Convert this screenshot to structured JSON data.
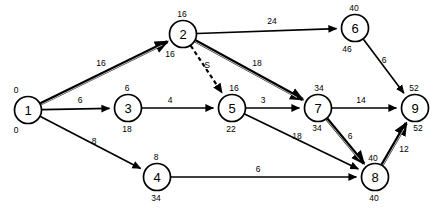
{
  "diagram": {
    "type": "activity-on-arrow-network",
    "background_color": "#ffffff",
    "line_color": "#000000",
    "critical_path": [
      "1",
      "2",
      "7",
      "8",
      "9"
    ],
    "nodes": [
      {
        "id": "1",
        "label": "1",
        "early": "0",
        "late": "0",
        "x": 28,
        "y": 110,
        "r": 13.5,
        "early_dx": -12,
        "early_dy": -17,
        "late_dx": -12,
        "late_dy": 23
      },
      {
        "id": "2",
        "label": "2",
        "early": "16",
        "late": "16",
        "x": 183,
        "y": 34,
        "r": 13.5,
        "early_dx": -1,
        "early_dy": -17,
        "late_dx": -13,
        "late_dy": 23
      },
      {
        "id": "3",
        "label": "3",
        "early": "6",
        "late": "18",
        "x": 128,
        "y": 108,
        "r": 13.5,
        "early_dx": -1,
        "early_dy": -17,
        "late_dx": -1,
        "late_dy": 24
      },
      {
        "id": "4",
        "label": "4",
        "early": "8",
        "late": "34",
        "x": 157,
        "y": 177,
        "r": 13.5,
        "early_dx": -1,
        "early_dy": -17,
        "late_dx": -1,
        "late_dy": 24
      },
      {
        "id": "5",
        "label": "5",
        "early": "16",
        "late": "22",
        "x": 232,
        "y": 108,
        "r": 13.5,
        "early_dx": 2,
        "early_dy": -17,
        "late_dx": -1,
        "late_dy": 24
      },
      {
        "id": "6",
        "label": "6",
        "early": "40",
        "late": "46",
        "x": 355,
        "y": 28,
        "r": 13.5,
        "early_dx": -1,
        "early_dy": -17,
        "late_dx": -8,
        "late_dy": 24
      },
      {
        "id": "7",
        "label": "7",
        "early": "34",
        "late": "34",
        "x": 318,
        "y": 108,
        "r": 13.5,
        "early_dx": 1,
        "early_dy": -17,
        "late_dx": -1,
        "late_dy": 23
      },
      {
        "id": "8",
        "label": "8",
        "early": "40",
        "late": "40",
        "x": 375,
        "y": 177,
        "r": 13.5,
        "early_dx": -2,
        "early_dy": -16,
        "late_dx": -1,
        "late_dy": 24
      },
      {
        "id": "9",
        "label": "9",
        "early": "52",
        "late": "52",
        "x": 415,
        "y": 108,
        "r": 13.5,
        "early_dx": -1,
        "early_dy": -17,
        "late_dx": 3,
        "late_dy": 23
      }
    ],
    "edges": [
      {
        "id": "e-1-2",
        "from": "1",
        "to": "2",
        "label": "16",
        "style": "critical",
        "label_x": 101,
        "label_y": 66
      },
      {
        "id": "e-1-3",
        "from": "1",
        "to": "3",
        "label": "6",
        "style": "normal",
        "label_x": 80,
        "label_y": 103
      },
      {
        "id": "e-1-4",
        "from": "1",
        "to": "4",
        "label": "8",
        "style": "normal",
        "label_x": 94,
        "label_y": 144
      },
      {
        "id": "e-2-6",
        "from": "2",
        "to": "6",
        "label": "24",
        "style": "normal",
        "label_x": 272,
        "label_y": 24
      },
      {
        "id": "e-2-7",
        "from": "2",
        "to": "7",
        "label": "18",
        "style": "critical",
        "label_x": 257,
        "label_y": 66
      },
      {
        "id": "e-2-5",
        "from": "2",
        "to": "5",
        "label": "S",
        "style": "dummy",
        "label_x": 207,
        "label_y": 68
      },
      {
        "id": "e-3-5",
        "from": "3",
        "to": "5",
        "label": "4",
        "style": "normal",
        "label_x": 170,
        "label_y": 103
      },
      {
        "id": "e-5-7",
        "from": "5",
        "to": "7",
        "label": "3",
        "style": "normal",
        "label_x": 263,
        "label_y": 103
      },
      {
        "id": "e-5-8",
        "from": "5",
        "to": "8",
        "label": "18",
        "style": "normal",
        "label_x": 297,
        "label_y": 139
      },
      {
        "id": "e-4-8",
        "from": "4",
        "to": "8",
        "label": "6",
        "style": "normal",
        "label_x": 258,
        "label_y": 172
      },
      {
        "id": "e-6-9",
        "from": "6",
        "to": "9",
        "label": "6",
        "style": "normal",
        "label_x": 384,
        "label_y": 63
      },
      {
        "id": "e-7-9",
        "from": "7",
        "to": "9",
        "label": "14",
        "style": "normal",
        "label_x": 361,
        "label_y": 103
      },
      {
        "id": "e-7-8",
        "from": "7",
        "to": "8",
        "label": "6",
        "style": "critical",
        "label_x": 350,
        "label_y": 139
      },
      {
        "id": "e-8-9",
        "from": "8",
        "to": "9",
        "label": "12",
        "style": "critical",
        "label_x": 404,
        "label_y": 152
      }
    ]
  }
}
